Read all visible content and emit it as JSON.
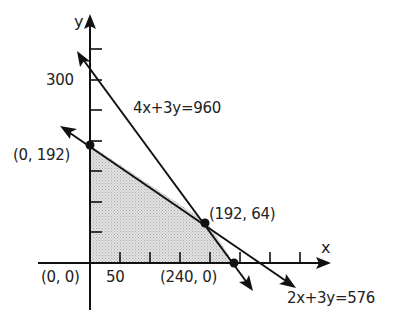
{
  "diagram": {
    "type": "linear-programming-feasible-region",
    "axes": {
      "x_label": "x",
      "y_label": "y",
      "x_tick_label": "50",
      "y_tick_label": "300",
      "tick_step": 50
    },
    "lines": [
      {
        "equation": "4x+3y=960",
        "label": "4x+3y=960"
      },
      {
        "equation": "2x+3y=576",
        "label": "2x+3y=576"
      }
    ],
    "vertices": [
      {
        "label": "(0, 192)",
        "x": 0,
        "y": 192
      },
      {
        "label": "(192, 64)",
        "x": 192,
        "y": 64
      },
      {
        "label": "(0, 0)",
        "x": 0,
        "y": 0
      },
      {
        "label": "(240, 0)",
        "x": 240,
        "y": 0
      }
    ],
    "colors": {
      "ink": "#111111",
      "feasible_fill": "#d4d4d4"
    }
  }
}
